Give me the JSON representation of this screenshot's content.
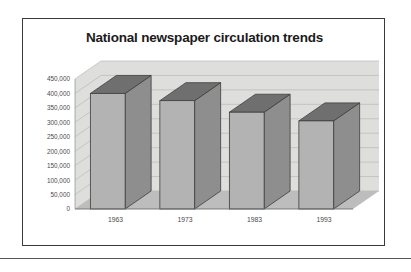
{
  "figure": {
    "title": "National newspaper circulation trends"
  },
  "chart_data": {
    "type": "bar",
    "title": "National newspaper circulation trends",
    "xlabel": "",
    "ylabel": "",
    "categories": [
      "1963",
      "1973",
      "1983",
      "1993"
    ],
    "values": [
      400000,
      375000,
      335000,
      305000
    ],
    "ylim": [
      0,
      450000
    ],
    "ytick_step": 50000,
    "ytick_labels": [
      "450,000",
      "400,000",
      "350,000",
      "300,000",
      "250,000",
      "200,000",
      "150,000",
      "100,000",
      "50,000",
      "0"
    ],
    "grid": true,
    "legend": false,
    "style": "3d-column",
    "colors": {
      "bar_front": "#b3b3b3",
      "bar_side": "#8e8e8e",
      "bar_top": "#6f6f6f",
      "bar_outline": "#3d3d3d",
      "back_wall": "#dededc",
      "floor": "#bdbdbd",
      "gridline": "#b9b9b7",
      "frame": "#3a3a3a",
      "title": "#1b1b1b",
      "tick_text": "#4a4a4a"
    }
  }
}
